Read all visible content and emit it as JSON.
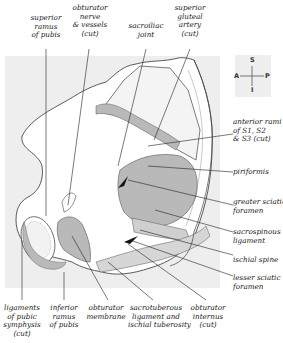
{
  "diagram": {
    "type": "anatomical illustration"
  },
  "compass": {
    "superior": "S",
    "inferior": "I",
    "anterior": "A",
    "posterior": "P"
  },
  "labels_top": [
    {
      "id": "superior-ramus",
      "lines": [
        "superior",
        "ramus",
        "of pubis"
      ]
    },
    {
      "id": "obturator-nerve",
      "lines": [
        "obturator",
        "nerve",
        "& vessels",
        "(cut)"
      ]
    },
    {
      "id": "sacroiliac-joint",
      "lines": [
        "sacroiliac",
        "joint"
      ]
    },
    {
      "id": "superior-gluteal-artery",
      "lines": [
        "superior",
        "gluteal",
        "artery",
        "(cut)"
      ]
    }
  ],
  "labels_right": [
    {
      "id": "anterior-rami",
      "lines": [
        "anterior rami",
        "of S1, S2",
        "& S3 (cut)"
      ]
    },
    {
      "id": "piriformis",
      "lines": [
        "piriformis"
      ]
    },
    {
      "id": "greater-sciatic-foramen",
      "lines": [
        "greater sciatic",
        "foramen"
      ]
    },
    {
      "id": "sacrospinous-ligament",
      "lines": [
        "sacrospinous",
        "ligament"
      ]
    },
    {
      "id": "ischial-spine",
      "lines": [
        "ischial spine"
      ]
    },
    {
      "id": "lesser-sciatic-foramen",
      "lines": [
        "lesser sciatic",
        "foramen"
      ]
    }
  ],
  "labels_bottom": [
    {
      "id": "ligaments-pubic-symphysis",
      "lines": [
        "ligaments",
        "of pubic",
        "symphysis",
        "(cut)"
      ]
    },
    {
      "id": "inferior-ramus",
      "lines": [
        "inferior",
        "ramus",
        "of pubis"
      ]
    },
    {
      "id": "obturator-membrane",
      "lines": [
        "obturator",
        "membrane"
      ]
    },
    {
      "id": "sacrotuberous-ligament",
      "lines": [
        "sacrotuberous",
        "ligament and",
        "ischial tuberosity"
      ]
    },
    {
      "id": "obturator-internus",
      "lines": [
        "obturator",
        "internus",
        "(cut)"
      ]
    }
  ],
  "colors": {
    "background_panel": "#eeeeee",
    "bone": "#ffffff",
    "muscle_gray": "#b9b9b9",
    "ligament_light": "#d6d6d6",
    "outline": "#333333"
  }
}
